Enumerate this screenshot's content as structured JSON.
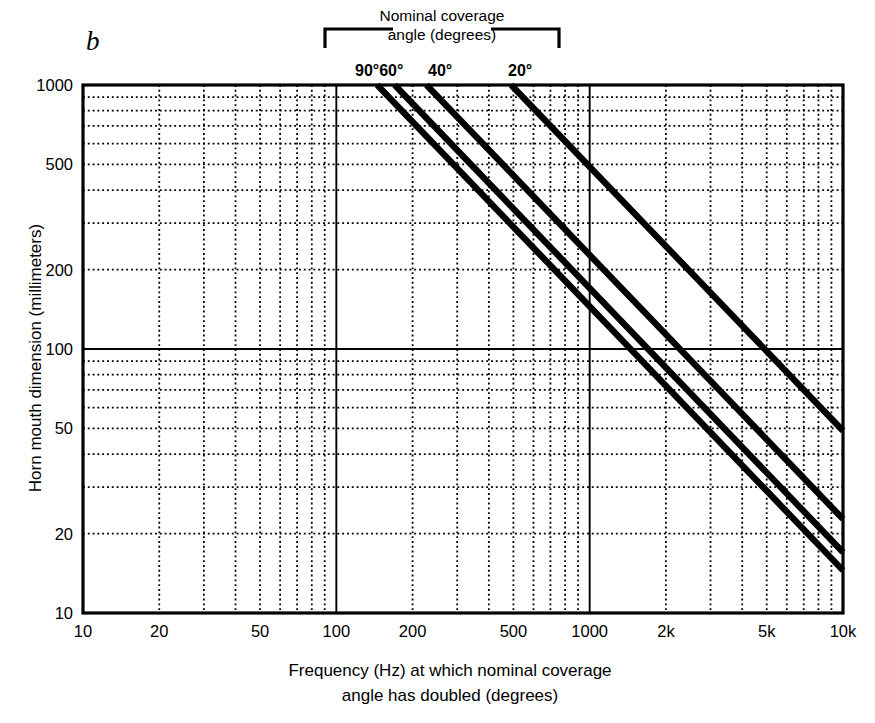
{
  "panel": {
    "letter": "b"
  },
  "top_annotation": {
    "line1": "Nominal coverage",
    "line2": "angle (degrees)",
    "bracket": "bracket-top"
  },
  "angle_labels": [
    {
      "id": "9060",
      "text": "90°60°"
    },
    {
      "id": "40",
      "text": "40°"
    },
    {
      "id": "20",
      "text": "20°"
    }
  ],
  "axes": {
    "x_title_line1": "Frequency (Hz) at which nominal coverage",
    "x_title_line2": "angle has doubled (degrees)",
    "y_title": "Horn mouth dimension (millimeters)"
  },
  "chart_data": {
    "type": "line",
    "title": "",
    "subtitle": "Nominal coverage angle (degrees)",
    "xlabel": "Frequency (Hz) at which nominal coverage angle has doubled (degrees)",
    "ylabel": "Horn mouth dimension (millimeters)",
    "xscale": "log",
    "yscale": "log",
    "xlim": [
      10,
      10000
    ],
    "ylim": [
      10,
      1000
    ],
    "xticks": [
      10,
      20,
      50,
      100,
      200,
      500,
      1000,
      2000,
      5000,
      10000
    ],
    "xticklabels": [
      "10",
      "20",
      "50",
      "100",
      "200",
      "500",
      "1000",
      "2k",
      "5k",
      "10k"
    ],
    "yticks": [
      10,
      20,
      50,
      100,
      200,
      500,
      1000
    ],
    "yticklabels": [
      "10",
      "20",
      "50",
      "100",
      "200",
      "500",
      "1000"
    ],
    "grid": "log-minor-dotted",
    "emphasized_gridlines": {
      "x": [
        100,
        1000
      ],
      "y": [
        100
      ]
    },
    "legend_position": "top-inline",
    "series": [
      {
        "name": "90°",
        "slope_loglog": -1,
        "points": [
          [
            145,
            1000
          ],
          [
            1450,
            100
          ],
          [
            10000,
            14.5
          ]
        ]
      },
      {
        "name": "60°",
        "slope_loglog": -1,
        "points": [
          [
            170,
            1000
          ],
          [
            1700,
            100
          ],
          [
            10000,
            17.0
          ]
        ]
      },
      {
        "name": "40°",
        "slope_loglog": -1,
        "points": [
          [
            227,
            1000
          ],
          [
            2270,
            100
          ],
          [
            10000,
            22.7
          ]
        ]
      },
      {
        "name": "20°",
        "slope_loglog": -1,
        "points": [
          [
            490,
            1000
          ],
          [
            4900,
            100
          ],
          [
            10000,
            49.0
          ]
        ]
      }
    ]
  },
  "colors": {
    "ink": "#000000",
    "background": "#ffffff",
    "grid": "#1a1a1a"
  }
}
